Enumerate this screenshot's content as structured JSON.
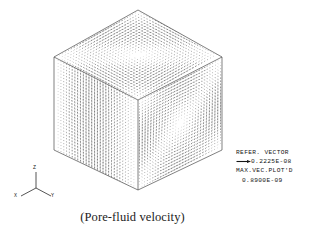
{
  "figure": {
    "caption": "(Pore-fluid velocity)",
    "background_color": "#ffffff",
    "line_color": "#555555",
    "vector_color": "#707070"
  },
  "legend": {
    "reference_vector_label": "REFER.  VECTOR",
    "reference_vector_value": "0.2225E-08",
    "max_vector_label": "MAX.VEC.PLOT'D",
    "max_vector_value": "0.8900E-09",
    "arrow_icon": "right-arrow-icon"
  },
  "axis_triad": {
    "z_label": "Z",
    "x_label": "X",
    "y_label": "Y"
  },
  "chart_data": {
    "type": "scatter",
    "title": "(Pore-fluid velocity)",
    "reference_vector": 2.225e-09,
    "reference_vector_text": "0.2225E-08",
    "max_vector_plotted": 8.9e-10,
    "max_vector_plotted_text": "0.8900E-09",
    "axes": [
      "X",
      "Y",
      "Z"
    ],
    "cube_vertices_px": {
      "top": [
        138,
        10
      ],
      "top_left": [
        54,
        57
      ],
      "top_right": [
        222,
        57
      ],
      "center": [
        138,
        100
      ],
      "bottom_left": [
        54,
        150
      ],
      "bottom_right": [
        222,
        150
      ],
      "bottom": [
        138,
        190
      ]
    },
    "faces": [
      {
        "name": "top",
        "pattern": "swirl",
        "grid": [
          30,
          30
        ]
      },
      {
        "name": "left",
        "pattern": "vertical-columns",
        "grid": [
          30,
          30
        ]
      },
      {
        "name": "right",
        "pattern": "concentric-vortex",
        "grid": [
          30,
          30
        ]
      }
    ],
    "grid": false,
    "legend_position": "right"
  }
}
